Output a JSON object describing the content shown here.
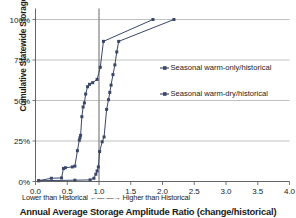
{
  "chart_data": {
    "type": "line",
    "title": "",
    "xlabel": "Annual Average Storage Amplitude Ratio (change/historical)",
    "ylabel": "Cumulative Statewide Storage Capacity",
    "axis_note_left": "Lower than Historical",
    "axis_note_arrow_left": "←—",
    "axis_note_arrow_right": "—→",
    "axis_note_right": "Higher than Historical",
    "xlim": [
      0.0,
      4.0
    ],
    "ylim": [
      0,
      100
    ],
    "xticks": [
      "0.0",
      "0.5",
      "1.0",
      "1.5",
      "2.0",
      "2.5",
      "3.0",
      "3.5",
      "4.0"
    ],
    "xtick_values": [
      0.0,
      0.5,
      1.0,
      1.5,
      2.0,
      2.5,
      3.0,
      3.5,
      4.0
    ],
    "yticks": [
      "0%",
      "25%",
      "50%",
      "75%",
      "100%"
    ],
    "ytick_values": [
      0,
      25,
      50,
      75,
      100
    ],
    "grid": "horizontal",
    "reference_line": {
      "x": 1.0,
      "color": "#808080",
      "label": "historical"
    },
    "legend_position": "right-middle",
    "series": [
      {
        "name": "Seasonal warm-only/historical",
        "color": "#3A4668",
        "marker": "square",
        "points": [
          [
            0.05,
            0.5
          ],
          [
            0.25,
            2.0
          ],
          [
            0.41,
            2.2
          ],
          [
            0.44,
            8.0
          ],
          [
            0.47,
            8.5
          ],
          [
            0.58,
            9.0
          ],
          [
            0.62,
            9.5
          ],
          [
            0.66,
            19.0
          ],
          [
            0.69,
            25.5
          ],
          [
            0.7,
            27.0
          ],
          [
            0.71,
            28.5
          ],
          [
            0.73,
            40.0
          ],
          [
            0.75,
            46.0
          ],
          [
            0.77,
            48.5
          ],
          [
            0.79,
            54.0
          ],
          [
            0.82,
            58.5
          ],
          [
            0.85,
            60.0
          ],
          [
            0.9,
            61.0
          ],
          [
            0.97,
            63.0
          ],
          [
            1.02,
            70.5
          ],
          [
            1.07,
            86.5
          ],
          [
            1.85,
            100.0
          ]
        ]
      },
      {
        "name": "Seasonal warm-dry/historical",
        "color": "#3A4668",
        "marker": "square",
        "points": [
          [
            0.05,
            0.5
          ],
          [
            0.62,
            0.8
          ],
          [
            0.86,
            1.0
          ],
          [
            0.92,
            2.0
          ],
          [
            0.95,
            4.5
          ],
          [
            0.97,
            6.5
          ],
          [
            0.99,
            9.0
          ],
          [
            1.01,
            18.5
          ],
          [
            1.05,
            24.5
          ],
          [
            1.08,
            27.5
          ],
          [
            1.12,
            44.5
          ],
          [
            1.15,
            50.5
          ],
          [
            1.17,
            55.0
          ],
          [
            1.19,
            59.5
          ],
          [
            1.22,
            66.0
          ],
          [
            1.25,
            72.0
          ],
          [
            1.28,
            80.0
          ],
          [
            1.31,
            86.5
          ],
          [
            2.18,
            100.0
          ]
        ]
      }
    ]
  }
}
